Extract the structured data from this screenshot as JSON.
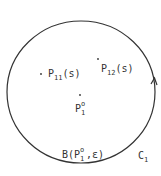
{
  "diagram": {
    "circle_label": "C",
    "circle_label_sub": "1",
    "ball_label": {
      "prefix": "B(P",
      "sup": "o",
      "sub": "1",
      "suffix": ",ε)"
    },
    "points": [
      {
        "label": "P",
        "sub": "11",
        "suffix": "(s)"
      },
      {
        "label": "P",
        "sub": "12",
        "suffix": "(s)"
      },
      {
        "label": "P",
        "sup": "o",
        "sub": "1"
      }
    ],
    "stroke_color": "#333333"
  }
}
